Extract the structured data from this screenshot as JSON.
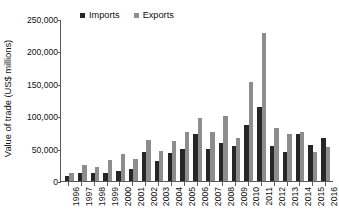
{
  "chart_data": {
    "type": "bar",
    "title": "",
    "xlabel": "",
    "ylabel": "Value of trade (US$ millions)",
    "ylim": [
      0,
      250000
    ],
    "ytick_values": [
      0,
      50000,
      100000,
      150000,
      200000,
      250000
    ],
    "ytick_labels": [
      "0",
      "50,000",
      "100,000",
      "150,000",
      "200,000",
      "250,000"
    ],
    "grid": false,
    "legend_position": "top-center",
    "categories": [
      "1996",
      "1997",
      "1998",
      "1999",
      "2000",
      "2001",
      "2002",
      "2003",
      "2004",
      "2005",
      "2006",
      "2007",
      "2008",
      "2009",
      "2010",
      "2011",
      "2012",
      "2013",
      "2014",
      "2015",
      "2016"
    ],
    "series": [
      {
        "name": "Imports",
        "color": "#262626",
        "values": [
          7000,
          13000,
          12500,
          12000,
          15000,
          19000,
          45000,
          31000,
          43000,
          49000,
          73000,
          50000,
          58000,
          54000,
          87000,
          114000,
          54000,
          45000,
          73000,
          56000,
          66000
        ]
      },
      {
        "name": "Exports",
        "color": "#8d8d8d",
        "values": [
          13000,
          25000,
          21000,
          32000,
          41000,
          34000,
          64000,
          46000,
          61000,
          76000,
          97000,
          76000,
          101000,
          66000,
          153000,
          228000,
          82000,
          72000,
          75000,
          45000,
          53000
        ]
      }
    ]
  },
  "legend": {
    "items": [
      {
        "label": "Imports",
        "color": "#262626"
      },
      {
        "label": "Exports",
        "color": "#8d8d8d"
      }
    ]
  }
}
